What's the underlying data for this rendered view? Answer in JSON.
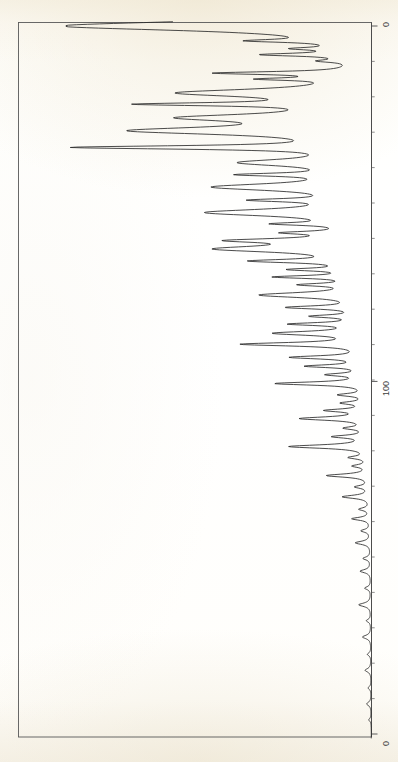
{
  "document": {
    "kind": "scanned-spectrum-chart",
    "orientation": "rotated-90-counterclockwise",
    "background_color": "#fdfbf6",
    "ink_color": "#2b2b2b"
  },
  "axis": {
    "name": "intensity-axis",
    "ticks": [
      {
        "label": "0",
        "value": 0,
        "pos": 0.0
      },
      {
        "label": "100",
        "value": 100,
        "pos": 0.502
      },
      {
        "label": "0",
        "value": 0,
        "pos": 1.0
      }
    ],
    "top_label": "0",
    "mid_label": "100",
    "bottom_label": "0"
  },
  "chart_data": {
    "type": "line",
    "title": "",
    "subtitle": "",
    "xlabel": "",
    "ylabel": "",
    "xlim": [
      0,
      200
    ],
    "ylim": [
      0,
      100
    ],
    "grid": false,
    "legend": "none",
    "annotations": [],
    "tick_labels": [
      "0",
      "100",
      "0"
    ],
    "series": [
      {
        "name": "trace",
        "color": "#2b2b2b",
        "peaks": [
          {
            "pos": 0,
            "height": 100.0,
            "width": 3.2
          },
          {
            "pos": 4.2,
            "height": 27.0,
            "width": 1.0
          },
          {
            "pos": 6.4,
            "height": 16.0,
            "width": 0.9
          },
          {
            "pos": 8.1,
            "height": 29.0,
            "width": 1.0
          },
          {
            "pos": 9.9,
            "height": 10.0,
            "width": 0.9
          },
          {
            "pos": 13.3,
            "height": 44.0,
            "width": 1.0
          },
          {
            "pos": 15.0,
            "height": 26.0,
            "width": 0.9
          },
          {
            "pos": 18.9,
            "height": 58.0,
            "width": 2.6
          },
          {
            "pos": 22.1,
            "height": 62.0,
            "width": 1.1
          },
          {
            "pos": 25.9,
            "height": 52.0,
            "width": 2.4
          },
          {
            "pos": 29.6,
            "height": 71.0,
            "width": 2.6
          },
          {
            "pos": 34.3,
            "height": 88.0,
            "width": 1.2
          },
          {
            "pos": 38.6,
            "height": 37.0,
            "width": 2.4
          },
          {
            "pos": 42.0,
            "height": 33.0,
            "width": 1.1
          },
          {
            "pos": 45.5,
            "height": 47.0,
            "width": 2.4
          },
          {
            "pos": 49.2,
            "height": 29.0,
            "width": 1.1
          },
          {
            "pos": 52.7,
            "height": 50.0,
            "width": 2.4
          },
          {
            "pos": 55.9,
            "height": 23.0,
            "width": 1.0
          },
          {
            "pos": 58.4,
            "height": 20.0,
            "width": 1.0
          },
          {
            "pos": 60.6,
            "height": 37.0,
            "width": 1.4
          },
          {
            "pos": 63.0,
            "height": 46.0,
            "width": 2.2
          },
          {
            "pos": 66.4,
            "height": 33.0,
            "width": 1.2
          },
          {
            "pos": 68.8,
            "height": 21.0,
            "width": 1.0
          },
          {
            "pos": 70.9,
            "height": 27.0,
            "width": 1.0
          },
          {
            "pos": 73.1,
            "height": 18.0,
            "width": 1.0
          },
          {
            "pos": 76.0,
            "height": 34.0,
            "width": 1.8
          },
          {
            "pos": 79.5,
            "height": 24.0,
            "width": 1.1
          },
          {
            "pos": 82.0,
            "height": 16.0,
            "width": 1.0
          },
          {
            "pos": 84.2,
            "height": 23.0,
            "width": 1.0
          },
          {
            "pos": 86.8,
            "height": 29.0,
            "width": 1.4
          },
          {
            "pos": 89.9,
            "height": 40.0,
            "width": 1.2
          },
          {
            "pos": 93.6,
            "height": 24.0,
            "width": 1.1
          },
          {
            "pos": 96.1,
            "height": 19.0,
            "width": 1.0
          },
          {
            "pos": 98.5,
            "height": 12.0,
            "width": 1.0
          },
          {
            "pos": 101.0,
            "height": 30.0,
            "width": 1.1
          },
          {
            "pos": 104.2,
            "height": 9.0,
            "width": 1.0
          },
          {
            "pos": 106.5,
            "height": 8.0,
            "width": 1.0
          },
          {
            "pos": 108.6,
            "height": 13.0,
            "width": 1.0
          },
          {
            "pos": 110.9,
            "height": 22.0,
            "width": 1.2
          },
          {
            "pos": 113.6,
            "height": 7.0,
            "width": 1.0
          },
          {
            "pos": 116.0,
            "height": 11.0,
            "width": 1.0
          },
          {
            "pos": 118.8,
            "height": 26.0,
            "width": 1.2
          },
          {
            "pos": 121.9,
            "height": 6.0,
            "width": 1.0
          },
          {
            "pos": 124.3,
            "height": 5.0,
            "width": 1.0
          },
          {
            "pos": 127.0,
            "height": 14.0,
            "width": 1.1
          },
          {
            "pos": 130.2,
            "height": 4.5,
            "width": 1.0
          },
          {
            "pos": 133.0,
            "height": 9.0,
            "width": 1.1
          },
          {
            "pos": 136.5,
            "height": 3.5,
            "width": 1.0
          },
          {
            "pos": 139.2,
            "height": 6.0,
            "width": 1.0
          },
          {
            "pos": 142.6,
            "height": 3.0,
            "width": 1.0
          },
          {
            "pos": 146.0,
            "height": 5.0,
            "width": 1.1
          },
          {
            "pos": 150.4,
            "height": 2.5,
            "width": 1.0
          },
          {
            "pos": 154.0,
            "height": 3.5,
            "width": 1.1
          },
          {
            "pos": 158.8,
            "height": 2.0,
            "width": 1.0
          },
          {
            "pos": 163.5,
            "height": 4.0,
            "width": 1.2
          },
          {
            "pos": 168.0,
            "height": 1.5,
            "width": 1.0
          },
          {
            "pos": 172.6,
            "height": 2.8,
            "width": 1.2
          },
          {
            "pos": 177.5,
            "height": 1.2,
            "width": 1.0
          },
          {
            "pos": 182.0,
            "height": 2.0,
            "width": 1.2
          },
          {
            "pos": 187.0,
            "height": 1.0,
            "width": 1.0
          },
          {
            "pos": 191.5,
            "height": 1.5,
            "width": 1.2
          },
          {
            "pos": 196.0,
            "height": 0.8,
            "width": 1.0
          }
        ]
      }
    ]
  },
  "frame": {
    "name": "plot-frame",
    "stroke": "#555555",
    "left": 18,
    "top": 22,
    "right": 372,
    "bottom": 737
  }
}
